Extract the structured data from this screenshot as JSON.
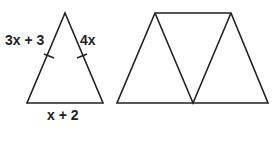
{
  "figure_left": {
    "type": "isosceles-triangle",
    "labels": {
      "left_side": "3x + 3",
      "right_side": "4x",
      "base": "x + 2"
    }
  },
  "figure_right": {
    "type": "trapezoid-of-three-triangles"
  },
  "colors": {
    "stroke": "#222222",
    "background": "#ffffff"
  }
}
